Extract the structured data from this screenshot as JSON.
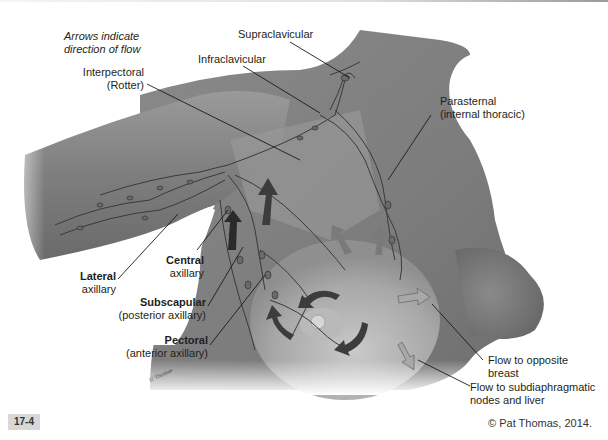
{
  "figure": {
    "number": "17-4",
    "copyright": "© Pat Thomas, 2014."
  },
  "note": {
    "line1": "Arrows indicate",
    "line2": "direction of flow"
  },
  "labels": {
    "supraclavicular": "Supraclavicular",
    "infraclavicular": "Infraclavicular",
    "interpectoral": {
      "line1": "Interpectoral",
      "line2": "(Rotter)"
    },
    "parasternal": {
      "line1": "Parasternal",
      "line2": "(internal thoracic)"
    },
    "lateral": {
      "bold": "Lateral",
      "normal": "axillary"
    },
    "central": {
      "bold": "Central",
      "normal": "axillary"
    },
    "subscapular": {
      "bold": "Subscapular",
      "normal": "(posterior axillary)"
    },
    "pectoral": {
      "bold": "Pectoral",
      "normal": "(anterior axillary)"
    },
    "opposite_breast": {
      "line1": "Flow to opposite",
      "line2": "breast"
    },
    "subdiaphragmatic": {
      "line1": "Flow to subdiaphragmatic",
      "line2": "nodes and liver"
    }
  },
  "colors": {
    "skin": "#8c8c8c",
    "skin_light": "#b4b4b4",
    "vessel": "#3a3a3a",
    "node": "#6a6a6a",
    "arrow_dark": "#3c3c3c",
    "arrow_mid": "#7a7a7a",
    "arrow_light": "#a8a8a8"
  }
}
